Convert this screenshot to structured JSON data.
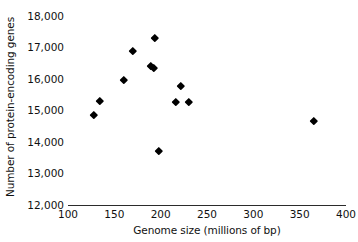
{
  "chart_data": {
    "type": "scatter",
    "title": "",
    "xlabel": "Genome size (millions of bp)",
    "ylabel": "Number of protein-encoding genes",
    "xlim": [
      100,
      400
    ],
    "ylim": [
      12000,
      18000
    ],
    "xticks": [
      100,
      150,
      200,
      250,
      300,
      350,
      400
    ],
    "xtick_labels": [
      "100",
      "150",
      "200",
      "250",
      "300",
      "350",
      "400"
    ],
    "yticks": [
      12000,
      13000,
      14000,
      15000,
      16000,
      17000,
      18000
    ],
    "ytick_labels": [
      "12,000",
      "13,000",
      "14,000",
      "15,000",
      "16,000",
      "17,000",
      "18,000"
    ],
    "grid": false,
    "legend": false,
    "marker": "diamond",
    "marker_color": "#000000",
    "x": [
      128,
      134,
      160,
      170,
      189,
      193,
      194,
      198,
      216,
      222,
      230,
      365
    ],
    "y": [
      14850,
      15300,
      15980,
      16880,
      16420,
      16350,
      17320,
      13720,
      15270,
      15780,
      15270,
      14660
    ],
    "points": [
      {
        "x": 128,
        "y": 14850
      },
      {
        "x": 134,
        "y": 15300
      },
      {
        "x": 160,
        "y": 15980
      },
      {
        "x": 170,
        "y": 16880
      },
      {
        "x": 189,
        "y": 16420
      },
      {
        "x": 193,
        "y": 16350
      },
      {
        "x": 194,
        "y": 17320
      },
      {
        "x": 198,
        "y": 13720
      },
      {
        "x": 216,
        "y": 15270
      },
      {
        "x": 222,
        "y": 15780
      },
      {
        "x": 230,
        "y": 15270
      },
      {
        "x": 365,
        "y": 14660
      }
    ]
  }
}
